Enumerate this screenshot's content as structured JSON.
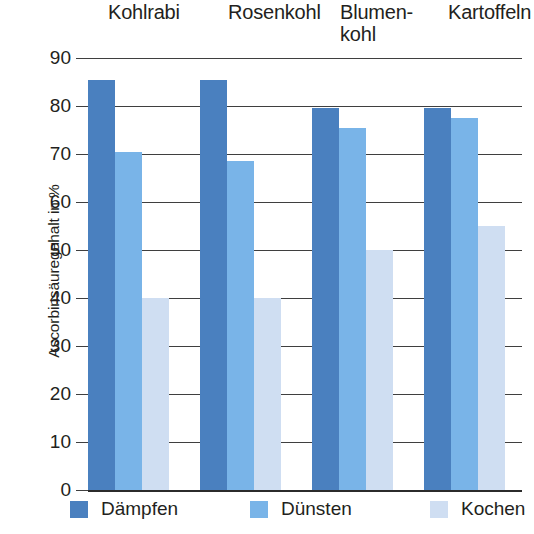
{
  "chart_data": {
    "type": "bar",
    "title": "",
    "xlabel": "",
    "ylabel": "Ascorbinsäuregehalt in %",
    "ylim": [
      0,
      90
    ],
    "ytick_step": 10,
    "yticks": [
      "90",
      "80",
      "70",
      "60",
      "50",
      "40",
      "30",
      "20",
      "10",
      "0"
    ],
    "grid": true,
    "legend_position": "bottom",
    "categories": [
      "Kohlrabi",
      "Rosenkohl",
      "Blumen-\nkohl",
      "Kartoffeln"
    ],
    "series": [
      {
        "name": "Dämpfen",
        "color": "#4a80bf",
        "values": [
          85.5,
          85.5,
          79.5,
          79.5
        ]
      },
      {
        "name": "Dünsten",
        "color": "#79b4e8",
        "values": [
          70.5,
          68.5,
          75.5,
          77.5
        ]
      },
      {
        "name": "Kochen",
        "color": "#cfdef2",
        "values": [
          40,
          40,
          50,
          55
        ]
      }
    ]
  },
  "layout": {
    "category_label_x": [
      108,
      228,
      340,
      448
    ],
    "group_start_x": [
      88,
      200,
      312,
      424
    ],
    "bar_width": 27,
    "legend_item_x": [
      70,
      250,
      430
    ]
  }
}
